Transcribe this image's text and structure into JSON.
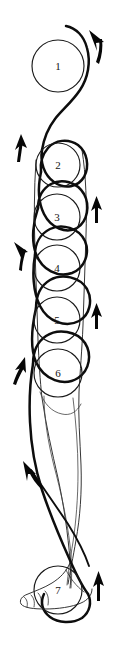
{
  "figure": {
    "background_color": "#ffffff",
    "ink_color": "#0d0d0d",
    "width": 116,
    "height": 645
  },
  "nodes": [
    {
      "label": "1",
      "cx": 58,
      "cy": 66,
      "r": 26
    },
    {
      "label": "2",
      "cx": 58,
      "cy": 165,
      "r": 22
    },
    {
      "label": "3",
      "cx": 57,
      "cy": 217,
      "r": 23
    },
    {
      "label": "4",
      "cx": 57,
      "cy": 268,
      "r": 23
    },
    {
      "label": "5",
      "cx": 57,
      "cy": 320,
      "r": 23
    },
    {
      "label": "6",
      "cx": 58,
      "cy": 373,
      "r": 24
    },
    {
      "label": "7",
      "cx": 58,
      "cy": 590,
      "r": 24
    }
  ],
  "arrows": [
    {
      "name": "arrow-top-right",
      "direction": "up-left",
      "x": 95,
      "y": 45
    },
    {
      "name": "arrow-left-2",
      "direction": "up",
      "x": 18,
      "y": 147
    },
    {
      "name": "arrow-right-3",
      "direction": "up",
      "x": 96,
      "y": 210
    },
    {
      "name": "arrow-left-4",
      "direction": "up-left",
      "x": 19,
      "y": 256
    },
    {
      "name": "arrow-right-5",
      "direction": "up",
      "x": 96,
      "y": 316
    },
    {
      "name": "arrow-left-6",
      "direction": "up-right",
      "x": 18,
      "y": 370
    },
    {
      "name": "arrow-mid-left",
      "direction": "up-left",
      "x": 29,
      "y": 475
    },
    {
      "name": "arrow-bottom-right",
      "direction": "up",
      "x": 98,
      "y": 586
    }
  ],
  "legend": {
    "node_count": 7,
    "arrow_count": 8
  }
}
